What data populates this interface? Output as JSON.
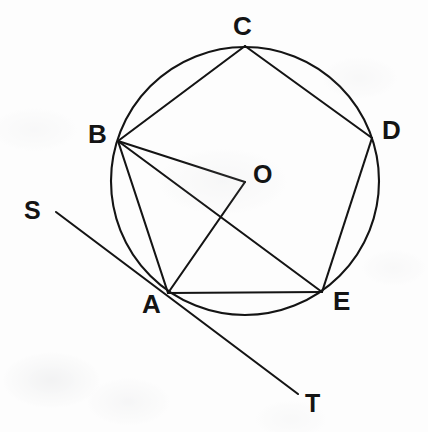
{
  "figure": {
    "background_color": "#fdfdfd",
    "ink_color": "#141414",
    "width": 428,
    "height": 432
  },
  "circle": {
    "name": "circumscribed-circle",
    "center_x": 245,
    "center_y": 181,
    "radius": 134,
    "stroke_color": "#141414",
    "stroke_width": 2.1
  },
  "points": [
    {
      "id": "A",
      "label": "A",
      "x": 168,
      "y": 293,
      "label_x": 142,
      "label_y": 291,
      "font_size": 26
    },
    {
      "id": "B",
      "label": "B",
      "x": 118,
      "y": 141,
      "label_x": 88,
      "label_y": 121,
      "font_size": 26
    },
    {
      "id": "C",
      "label": "C",
      "x": 245,
      "y": 46,
      "label_x": 233,
      "label_y": 13,
      "font_size": 26
    },
    {
      "id": "D",
      "label": "D",
      "x": 372,
      "y": 138,
      "label_x": 382,
      "label_y": 117,
      "font_size": 26
    },
    {
      "id": "E",
      "label": "E",
      "x": 322,
      "y": 292,
      "label_x": 333,
      "label_y": 288,
      "font_size": 26
    },
    {
      "id": "O",
      "label": "O",
      "x": 245,
      "y": 182,
      "label_x": 253,
      "label_y": 162,
      "font_size": 25
    },
    {
      "id": "S",
      "label": "S",
      "x": 56,
      "y": 212,
      "label_x": 24,
      "label_y": 198,
      "font_size": 25
    },
    {
      "id": "T",
      "label": "T",
      "x": 298,
      "y": 394,
      "label_x": 305,
      "label_y": 391,
      "font_size": 25
    }
  ],
  "segments": [
    {
      "name": "chord-AB",
      "from": "A",
      "to": "B",
      "x1": 168,
      "y1": 293,
      "x2": 118,
      "y2": 141
    },
    {
      "name": "chord-BC",
      "from": "B",
      "to": "C",
      "x1": 118,
      "y1": 141,
      "x2": 245,
      "y2": 46
    },
    {
      "name": "chord-CD",
      "from": "C",
      "to": "D",
      "x1": 245,
      "y1": 46,
      "x2": 372,
      "y2": 138
    },
    {
      "name": "chord-DE",
      "from": "D",
      "to": "E",
      "x1": 372,
      "y1": 138,
      "x2": 322,
      "y2": 292
    },
    {
      "name": "chord-EA",
      "from": "E",
      "to": "A",
      "x1": 322,
      "y1": 292,
      "x2": 168,
      "y2": 293
    },
    {
      "name": "chord-BE",
      "from": "B",
      "to": "E",
      "x1": 118,
      "y1": 141,
      "x2": 322,
      "y2": 292
    },
    {
      "name": "radius-BO",
      "from": "B",
      "to": "O",
      "x1": 118,
      "y1": 141,
      "x2": 245,
      "y2": 182
    },
    {
      "name": "radius-AO",
      "from": "A",
      "to": "O",
      "x1": 168,
      "y1": 293,
      "x2": 245,
      "y2": 182
    },
    {
      "name": "tangent-ST",
      "from": "S",
      "to": "T",
      "x1": 56,
      "y1": 212,
      "x2": 298,
      "y2": 394
    }
  ],
  "labels_list": [
    "A",
    "B",
    "C",
    "D",
    "E",
    "O",
    "S",
    "T"
  ]
}
